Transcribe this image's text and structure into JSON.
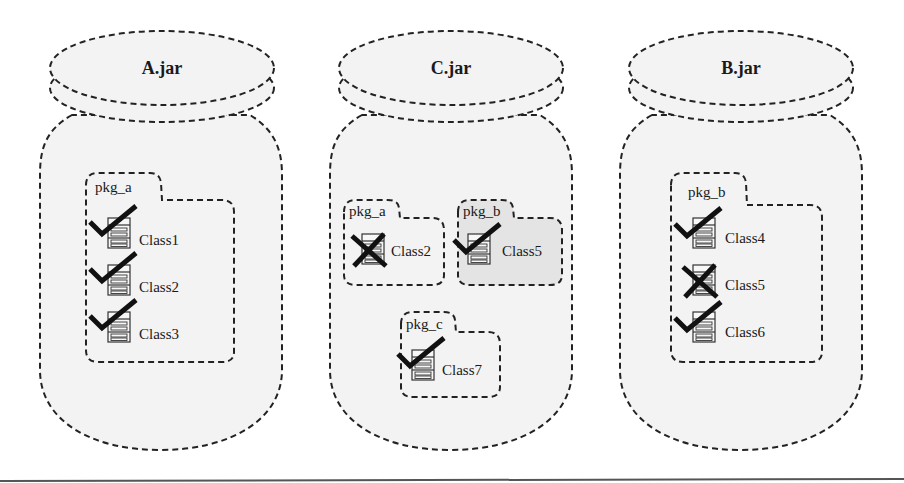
{
  "colors": {
    "jar_fill": "#f3f3f3",
    "pkg_fill": "#f3f3f3",
    "pkg_highlight_fill": "#e4e4e4",
    "stroke": "#222222",
    "mark": "#111111"
  },
  "jars": [
    {
      "label": "A.jar",
      "packages": [
        {
          "label": "pkg_a",
          "highlighted": false,
          "classes": [
            {
              "label": "Class1",
              "status": "check"
            },
            {
              "label": "Class2",
              "status": "check"
            },
            {
              "label": "Class3",
              "status": "check"
            }
          ]
        }
      ]
    },
    {
      "label": "C.jar",
      "packages": [
        {
          "label": "pkg_a",
          "highlighted": false,
          "classes": [
            {
              "label": "Class2",
              "status": "cross"
            }
          ]
        },
        {
          "label": "pkg_b",
          "highlighted": true,
          "classes": [
            {
              "label": "Class5",
              "status": "check"
            }
          ]
        },
        {
          "label": "pkg_c",
          "highlighted": false,
          "classes": [
            {
              "label": "Class7",
              "status": "check"
            }
          ]
        }
      ]
    },
    {
      "label": "B.jar",
      "packages": [
        {
          "label": "pkg_b",
          "highlighted": false,
          "classes": [
            {
              "label": "Class4",
              "status": "check"
            },
            {
              "label": "Class5",
              "status": "cross"
            },
            {
              "label": "Class6",
              "status": "check"
            }
          ]
        }
      ]
    }
  ]
}
